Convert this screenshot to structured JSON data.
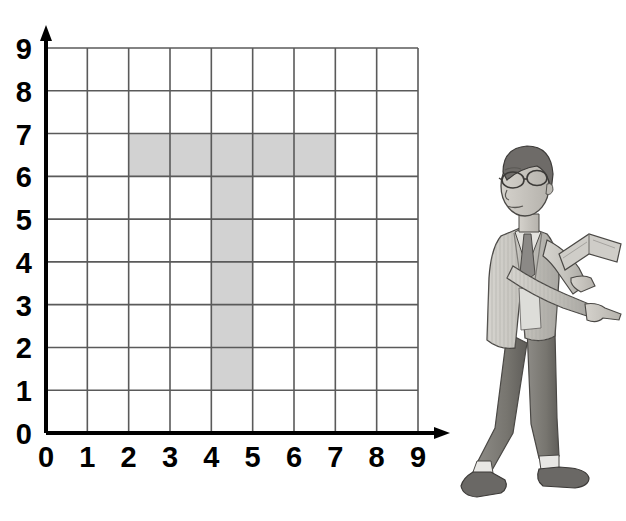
{
  "figure": {
    "kind": "coordinate-grid-worksheet",
    "axes": {
      "x_label_values": [
        "0",
        "1",
        "2",
        "3",
        "4",
        "5",
        "6",
        "7",
        "8",
        "9"
      ],
      "y_label_values": [
        "0",
        "1",
        "2",
        "3",
        "4",
        "5",
        "6",
        "7",
        "8",
        "9"
      ],
      "x_arrow": "right-arrow-icon",
      "y_arrow": "up-arrow-icon"
    },
    "colors": {
      "grid_line": "#5a5a5a",
      "axis_line": "#000000",
      "shaded_cell": "#d2d2d2",
      "shaded_cell_border": "#b9b9b9",
      "label_text": "#000000",
      "background": "#ffffff"
    }
  },
  "chart_data": {
    "type": "heatmap",
    "title": "",
    "subtitle": "",
    "xlabel": "",
    "ylabel": "",
    "xlim": [
      0,
      9
    ],
    "ylim": [
      0,
      9
    ],
    "grid": true,
    "legend": "none",
    "cell_size": 1,
    "x_ticks": [
      0,
      1,
      2,
      3,
      4,
      5,
      6,
      7,
      8,
      9
    ],
    "y_ticks": [
      0,
      1,
      2,
      3,
      4,
      5,
      6,
      7,
      8,
      9
    ],
    "x_tick_labels": [
      "0",
      "1",
      "2",
      "3",
      "4",
      "5",
      "6",
      "7",
      "8",
      "9"
    ],
    "y_tick_labels": [
      "0",
      "1",
      "2",
      "3",
      "4",
      "5",
      "6",
      "7",
      "8",
      "9"
    ],
    "shape_name": "T",
    "shaded_cell_count": 11,
    "shaded_cells": [
      {
        "x": 2,
        "y": 6
      },
      {
        "x": 3,
        "y": 6
      },
      {
        "x": 4,
        "y": 6
      },
      {
        "x": 5,
        "y": 6
      },
      {
        "x": 6,
        "y": 6
      },
      {
        "x": 4,
        "y": 5
      },
      {
        "x": 4,
        "y": 4
      },
      {
        "x": 4,
        "y": 3
      },
      {
        "x": 4,
        "y": 2
      },
      {
        "x": 4,
        "y": 1
      }
    ],
    "shaded_regions": [
      {
        "name": "horizontal-bar",
        "x_from": 2,
        "x_to": 7,
        "y_from": 6,
        "y_to": 7
      },
      {
        "name": "vertical-stem",
        "x_from": 4,
        "x_to": 5,
        "y_from": 1,
        "y_to": 7
      }
    ],
    "annotations": []
  },
  "illustration": {
    "name": "teacher-pointing",
    "description": "Grayscale drawing of a man with glasses wearing a pinstriped jacket and tie, holding an open book and pointing toward the grid",
    "colors": {
      "skin": "#c9c6c0",
      "hair": "#6e6b68",
      "jacket": "#c3c1bb",
      "trousers": "#7d7b76",
      "shoes": "#6a6865",
      "book": "#9b9894",
      "outline": "#4a4845"
    }
  }
}
